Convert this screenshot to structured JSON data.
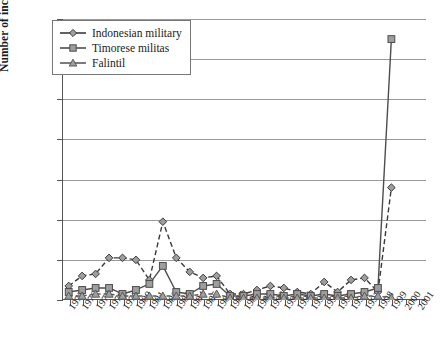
{
  "chart_data": {
    "type": "line",
    "title": "",
    "xlabel": "",
    "ylabel": "Number of incidents",
    "ylim": [
      0,
      140
    ],
    "ytick_step": 20,
    "yticks": [
      0,
      20,
      40,
      60,
      80,
      100,
      120,
      140
    ],
    "grid": "horizontal",
    "legend_position": "top-left",
    "categories": [
      "1975",
      "1976",
      "1977",
      "1978",
      "1979",
      "1980",
      "1981",
      "1982",
      "1983",
      "1984",
      "1985",
      "1986",
      "1987",
      "1988",
      "1989",
      "1990",
      "1991",
      "1992",
      "1993",
      "1994",
      "1995",
      "1996",
      "1997",
      "1998",
      "1999",
      "2000",
      "2001"
    ],
    "series": [
      {
        "name": "Indonesian military",
        "marker": "diamond",
        "color": "#3a3a3a",
        "values": [
          7,
          12,
          13,
          21,
          21,
          20,
          10,
          39,
          21,
          14,
          11,
          12,
          3,
          3,
          5,
          7,
          6,
          4,
          3,
          9,
          4,
          10,
          11,
          4,
          56,
          null,
          null
        ]
      },
      {
        "name": "Timorese militas",
        "marker": "square",
        "color": "#4d4d4d",
        "values": [
          4,
          5,
          6,
          6,
          3,
          5,
          8,
          17,
          4,
          3,
          7,
          8,
          2,
          2,
          3,
          3,
          2,
          3,
          2,
          3,
          2,
          3,
          4,
          6,
          130,
          null,
          null
        ]
      },
      {
        "name": "Falintil",
        "marker": "triangle",
        "color": "#5a5a5a",
        "values": [
          2,
          2,
          3,
          3,
          2,
          2,
          2,
          2,
          2,
          2,
          3,
          3,
          1,
          1,
          1,
          1,
          1,
          1,
          1,
          1,
          1,
          1,
          2,
          2,
          1,
          null,
          null
        ]
      }
    ]
  },
  "legend": {
    "items": [
      {
        "label": "Indonesian military",
        "marker": "diamond"
      },
      {
        "label": "Timorese militas",
        "marker": "square"
      },
      {
        "label": "Falintil",
        "marker": "triangle"
      }
    ]
  },
  "colors": {
    "axis": "#555555",
    "grid": "#9a9a9a",
    "background": "#ffffff",
    "series_indonesian": "#3a3a3a",
    "series_timorese": "#4d4d4d",
    "series_falintil": "#5a5a5a"
  }
}
